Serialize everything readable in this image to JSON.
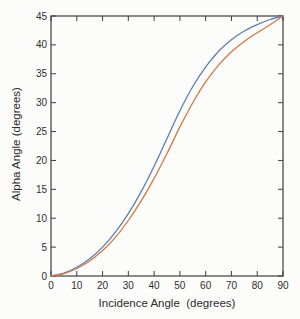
{
  "figure": {
    "background": "#fcfcfa",
    "frame_color": "#3d3d3d",
    "tick_label_color": "#2e2e2e"
  },
  "chart_data": {
    "type": "line",
    "title": "",
    "xlabel": "Incidence Angle  (degrees)",
    "ylabel": "Alpha Angle (degrees)",
    "xlim": [
      0,
      90
    ],
    "ylim": [
      0,
      45
    ],
    "x_ticks": [
      0,
      10,
      20,
      30,
      40,
      50,
      60,
      70,
      80,
      90
    ],
    "y_ticks": [
      0,
      5,
      10,
      15,
      20,
      25,
      30,
      35,
      40,
      45
    ],
    "grid": false,
    "legend": "none",
    "box": true,
    "tick_direction": "in",
    "x": [
      0,
      5,
      10,
      15,
      20,
      25,
      30,
      35,
      40,
      45,
      50,
      55,
      60,
      65,
      70,
      75,
      80,
      85,
      90
    ],
    "series": [
      {
        "name": "alpha-curve-upper",
        "color": "#5d7fb2",
        "values": [
          0,
          0.5,
          1.5,
          3.0,
          5.0,
          7.6,
          10.8,
          14.6,
          19.0,
          23.8,
          28.6,
          32.8,
          36.2,
          38.9,
          40.9,
          42.4,
          43.5,
          44.4,
          45
        ]
      },
      {
        "name": "alpha-curve-lower",
        "color": "#cd7a42",
        "values": [
          0,
          0.4,
          1.3,
          2.6,
          4.4,
          6.7,
          9.6,
          13.0,
          16.9,
          21.2,
          25.8,
          30.0,
          33.6,
          36.5,
          38.8,
          40.6,
          42.1,
          43.5,
          45
        ]
      }
    ]
  }
}
